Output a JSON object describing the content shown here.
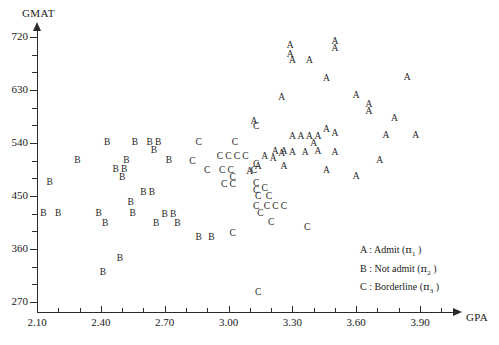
{
  "chart_data": {
    "type": "scatter",
    "title": "",
    "xlabel": "GPA",
    "ylabel": "GMAT",
    "xlim": [
      2.1,
      4.02
    ],
    "ylim": [
      263,
      740
    ],
    "xticks": [
      "2.10",
      "2.40",
      "2.70",
      "3.00",
      "3.30",
      "3.60",
      "3.90"
    ],
    "xtick_values": [
      2.1,
      2.4,
      2.7,
      3.0,
      3.3,
      3.6,
      3.9
    ],
    "yticks": [
      "270",
      "360",
      "450",
      "540",
      "630",
      "720"
    ],
    "ytick_values": [
      270,
      360,
      450,
      540,
      630,
      720
    ],
    "grid": false,
    "legend_position": "inside-lower-right",
    "series": [
      {
        "name": "A",
        "label": "Admit",
        "marker": "A",
        "points": [
          [
            3.12,
            575
          ],
          [
            3.3,
            680
          ],
          [
            3.38,
            680
          ],
          [
            3.29,
            705
          ],
          [
            3.29,
            690
          ],
          [
            3.5,
            712
          ],
          [
            3.5,
            700
          ],
          [
            3.46,
            648
          ],
          [
            3.84,
            651
          ],
          [
            3.6,
            620
          ],
          [
            3.66,
            605
          ],
          [
            3.66,
            592
          ],
          [
            3.25,
            617
          ],
          [
            3.78,
            580
          ],
          [
            3.3,
            550
          ],
          [
            3.34,
            550
          ],
          [
            3.38,
            550
          ],
          [
            3.42,
            550
          ],
          [
            3.46,
            562
          ],
          [
            3.5,
            556
          ],
          [
            3.74,
            552
          ],
          [
            3.88,
            552
          ],
          [
            3.3,
            523
          ],
          [
            3.36,
            523
          ],
          [
            3.42,
            524
          ],
          [
            3.5,
            523
          ],
          [
            3.22,
            525
          ],
          [
            3.26,
            525
          ],
          [
            3.4,
            538
          ],
          [
            3.26,
            500
          ],
          [
            3.46,
            493
          ],
          [
            3.6,
            483
          ],
          [
            3.71,
            510
          ],
          [
            3.17,
            516
          ],
          [
            3.21,
            513
          ],
          [
            3.25,
            522
          ],
          [
            3.14,
            500
          ],
          [
            3.1,
            490
          ]
        ]
      },
      {
        "name": "B",
        "label": "Not admit",
        "marker": "B",
        "points": [
          [
            2.43,
            540
          ],
          [
            2.56,
            540
          ],
          [
            2.63,
            540
          ],
          [
            2.67,
            540
          ],
          [
            2.65,
            527
          ],
          [
            2.29,
            510
          ],
          [
            2.52,
            510
          ],
          [
            2.72,
            510
          ],
          [
            2.47,
            495
          ],
          [
            2.51,
            495
          ],
          [
            2.5,
            480
          ],
          [
            2.16,
            472
          ],
          [
            2.6,
            455
          ],
          [
            2.64,
            455
          ],
          [
            2.54,
            438
          ],
          [
            2.13,
            420
          ],
          [
            2.2,
            420
          ],
          [
            2.39,
            420
          ],
          [
            2.55,
            420
          ],
          [
            2.7,
            418
          ],
          [
            2.74,
            418
          ],
          [
            2.42,
            403
          ],
          [
            2.66,
            402
          ],
          [
            2.76,
            402
          ],
          [
            2.86,
            378
          ],
          [
            2.92,
            378
          ],
          [
            2.49,
            343
          ],
          [
            2.41,
            320
          ]
        ]
      },
      {
        "name": "C",
        "label": "Borderline",
        "marker": "C",
        "points": [
          [
            2.86,
            540
          ],
          [
            3.03,
            540
          ],
          [
            2.96,
            516
          ],
          [
            3.0,
            516
          ],
          [
            3.04,
            516
          ],
          [
            3.08,
            516
          ],
          [
            3.13,
            567
          ],
          [
            2.83,
            508
          ],
          [
            2.9,
            492
          ],
          [
            2.97,
            492
          ],
          [
            3.01,
            492
          ],
          [
            3.12,
            492
          ],
          [
            3.13,
            503
          ],
          [
            3.02,
            480
          ],
          [
            2.98,
            468
          ],
          [
            3.02,
            468
          ],
          [
            3.13,
            470
          ],
          [
            3.13,
            459
          ],
          [
            3.17,
            462
          ],
          [
            3.14,
            448
          ],
          [
            3.19,
            448
          ],
          [
            3.13,
            432
          ],
          [
            3.18,
            432
          ],
          [
            3.22,
            432
          ],
          [
            3.26,
            432
          ],
          [
            3.15,
            420
          ],
          [
            3.2,
            405
          ],
          [
            3.14,
            285
          ],
          [
            3.37,
            395
          ],
          [
            3.02,
            385
          ]
        ]
      }
    ]
  },
  "axes": {
    "y_title": "GMAT",
    "x_title": "GPA"
  },
  "legend": {
    "items": [
      {
        "key": "A",
        "sep": ":",
        "text": "Admit",
        "paren_open": "(",
        "pi": "π",
        "sub": "1",
        "paren_close": ")"
      },
      {
        "key": "B",
        "sep": ":",
        "text": "Not admit",
        "paren_open": "(",
        "pi": "π",
        "sub": "2",
        "paren_close": ")"
      },
      {
        "key": "C",
        "sep": ":",
        "text": "Borderline",
        "paren_open": "(",
        "pi": "π",
        "sub": "3",
        "paren_close": ")"
      }
    ]
  },
  "colors": {
    "axis": "#2b2b2b",
    "text": "#1a1a1a",
    "marker": "#262626",
    "background": "#ffffff"
  }
}
